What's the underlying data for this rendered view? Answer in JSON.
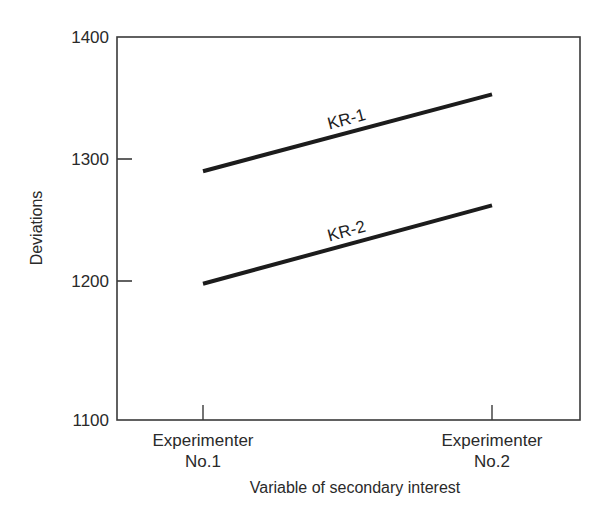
{
  "chart_data": {
    "type": "line",
    "title": "",
    "xlabel": "Variable of secondary interest",
    "ylabel": "Deviations",
    "categories": [
      [
        "Experimenter",
        "No.1"
      ],
      [
        "Experimenter",
        "No.2"
      ]
    ],
    "series": [
      {
        "name": "KR-1",
        "values": [
          1290,
          1353
        ]
      },
      {
        "name": "KR-2",
        "values": [
          1198,
          1262
        ]
      }
    ],
    "ylim": [
      1100,
      1400
    ],
    "yticks": [
      1100,
      1200,
      1300,
      1400
    ],
    "grid": false,
    "legend": "inline labels above lines",
    "colors": {
      "line": "#1c1c1c",
      "axis": "#3a3a3a",
      "text": "#2a2a2a"
    }
  }
}
